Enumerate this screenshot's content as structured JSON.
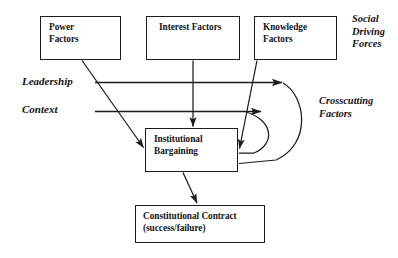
{
  "diagram": {
    "stroke_color": "#1c1c1c",
    "text_color": "#151515",
    "background": "#ffffff",
    "nodes": [
      {
        "id": "power",
        "lines": [
          "Power",
          "Factors"
        ]
      },
      {
        "id": "interest",
        "lines": [
          "Interest Factors"
        ]
      },
      {
        "id": "knowledge",
        "lines": [
          "Knowledge",
          "Factors"
        ]
      },
      {
        "id": "institutional",
        "lines": [
          "Institutional",
          "Bargaining"
        ]
      },
      {
        "id": "constitutional",
        "lines": [
          "Constitutional Contract",
          "(success/failure)"
        ]
      }
    ],
    "labels": {
      "social_driving_forces": [
        "Social",
        "Driving",
        "Forces"
      ],
      "crosscutting_factors": [
        "Crosscutting",
        "Factors"
      ],
      "leadership": "Leadership",
      "context": "Context"
    },
    "edges": [
      {
        "id": "power-to-institutional",
        "from": "power",
        "to": "institutional",
        "style": "diagonal-arrow"
      },
      {
        "id": "interest-to-institutional",
        "from": "interest",
        "to": "institutional",
        "style": "vertical-arrow"
      },
      {
        "id": "knowledge-to-institutional",
        "from": "knowledge",
        "to": "institutional",
        "style": "diagonal-arrow"
      },
      {
        "id": "leadership-to-knowledge",
        "from": "leadership",
        "to": "knowledge",
        "style": "horizontal-arrow"
      },
      {
        "id": "context-to-crosscutting",
        "from": "context",
        "to": "crosscutting",
        "style": "horizontal-arrow"
      },
      {
        "id": "institutional-feedback-inner",
        "from": "institutional",
        "to": "context",
        "style": "curved-arc"
      },
      {
        "id": "institutional-feedback-outer",
        "from": "institutional",
        "to": "leadership",
        "style": "curved-arc"
      },
      {
        "id": "institutional-to-constitutional",
        "from": "institutional",
        "to": "constitutional",
        "style": "diagonal-arrow"
      }
    ]
  }
}
